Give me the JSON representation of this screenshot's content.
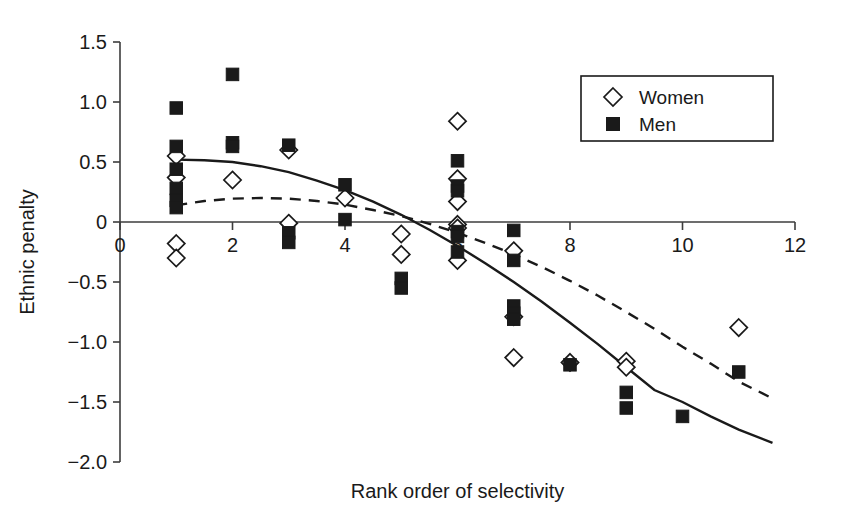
{
  "chart_data": {
    "type": "scatter",
    "title": "",
    "xlabel": "Rank order of selectivity",
    "ylabel": "Ethnic penalty",
    "xlim": [
      0,
      12
    ],
    "ylim": [
      -2.0,
      1.5
    ],
    "xticks": [
      0,
      2,
      4,
      6,
      8,
      10,
      12
    ],
    "xtick_labels": [
      "0",
      "2",
      "4",
      "6",
      "8",
      "10",
      "12"
    ],
    "yticks": [
      1.5,
      1.0,
      0.5,
      0,
      -0.5,
      -1.0,
      -1.5,
      -2.0
    ],
    "ytick_labels": [
      "1.5",
      "1.0",
      "0.5",
      "0",
      "−0.5",
      "−1.0",
      "−1.5",
      "−2.0"
    ],
    "grid": false,
    "zero_line": true,
    "legend_position": "top-right",
    "legend": [
      {
        "name": "Women",
        "marker": "open-diamond"
      },
      {
        "name": "Men",
        "marker": "filled-square"
      }
    ],
    "series": [
      {
        "name": "Women",
        "marker": "open-diamond",
        "points": [
          [
            1,
            0.55
          ],
          [
            1,
            0.37
          ],
          [
            1,
            -0.18
          ],
          [
            1,
            -0.3
          ],
          [
            2,
            0.35
          ],
          [
            3,
            0.6
          ],
          [
            3,
            -0.01
          ],
          [
            4,
            0.2
          ],
          [
            5,
            -0.1
          ],
          [
            5,
            -0.27
          ],
          [
            6,
            0.84
          ],
          [
            6,
            0.36
          ],
          [
            6,
            0.17
          ],
          [
            6,
            -0.02
          ],
          [
            6,
            -0.05
          ],
          [
            6,
            -0.32
          ],
          [
            7,
            -0.24
          ],
          [
            7,
            -0.79
          ],
          [
            7,
            -1.13
          ],
          [
            8,
            -1.17
          ],
          [
            9,
            -1.16
          ],
          [
            9,
            -1.21
          ],
          [
            11,
            -0.88
          ]
        ]
      },
      {
        "name": "Men",
        "marker": "filled-square",
        "points": [
          [
            1,
            0.95
          ],
          [
            1,
            0.63
          ],
          [
            1,
            0.44
          ],
          [
            1,
            0.28
          ],
          [
            1,
            0.18
          ],
          [
            1,
            0.12
          ],
          [
            2,
            1.23
          ],
          [
            2,
            0.66
          ],
          [
            2,
            0.63
          ],
          [
            3,
            0.64
          ],
          [
            3,
            -0.09
          ],
          [
            3,
            -0.17
          ],
          [
            4,
            0.31
          ],
          [
            4,
            0.02
          ],
          [
            5,
            -0.47
          ],
          [
            5,
            -0.55
          ],
          [
            6,
            0.51
          ],
          [
            6,
            0.3
          ],
          [
            6,
            0.26
          ],
          [
            6,
            -0.08
          ],
          [
            6,
            -0.12
          ],
          [
            6,
            -0.25
          ],
          [
            7,
            -0.07
          ],
          [
            7,
            -0.32
          ],
          [
            7,
            -0.7
          ],
          [
            7,
            -0.76
          ],
          [
            7,
            -0.81
          ],
          [
            8,
            -1.19
          ],
          [
            9,
            -1.42
          ],
          [
            9,
            -1.55
          ],
          [
            10,
            -1.62
          ],
          [
            11,
            -1.25
          ]
        ]
      }
    ],
    "fit_lines": [
      {
        "name": "Men fit",
        "style": "solid",
        "description": "Quadratic fit for Men, starts ~0.52 at x=1, crosses zero near x=4.9, ends ~-1.83 at x=11.6",
        "points": [
          [
            1.0,
            0.52
          ],
          [
            1.5,
            0.515
          ],
          [
            2.0,
            0.5
          ],
          [
            2.5,
            0.465
          ],
          [
            3.0,
            0.415
          ],
          [
            3.5,
            0.345
          ],
          [
            4.0,
            0.265
          ],
          [
            4.5,
            0.17
          ],
          [
            5.0,
            0.06
          ],
          [
            5.5,
            -0.065
          ],
          [
            6.0,
            -0.2
          ],
          [
            6.5,
            -0.345
          ],
          [
            7.0,
            -0.5
          ],
          [
            7.5,
            -0.665
          ],
          [
            8.0,
            -0.84
          ],
          [
            8.5,
            -1.02
          ],
          [
            9.0,
            -1.21
          ],
          [
            9.5,
            -1.4
          ],
          [
            10.0,
            -1.5
          ],
          [
            10.5,
            -1.62
          ],
          [
            11.0,
            -1.73
          ],
          [
            11.6,
            -1.84
          ]
        ]
      },
      {
        "name": "Women fit",
        "style": "dashed",
        "description": "Quadratic fit for Women, peaks ~0.20 near x=2.5, crosses zero near x=5.6, ends ~-1.47 at x=11.6",
        "points": [
          [
            1.0,
            0.14
          ],
          [
            1.5,
            0.175
          ],
          [
            2.0,
            0.195
          ],
          [
            2.5,
            0.2
          ],
          [
            3.0,
            0.195
          ],
          [
            3.5,
            0.175
          ],
          [
            4.0,
            0.145
          ],
          [
            4.5,
            0.1
          ],
          [
            5.0,
            0.05
          ],
          [
            5.5,
            -0.015
          ],
          [
            6.0,
            -0.09
          ],
          [
            6.5,
            -0.175
          ],
          [
            7.0,
            -0.27
          ],
          [
            7.5,
            -0.375
          ],
          [
            8.0,
            -0.49
          ],
          [
            8.5,
            -0.615
          ],
          [
            9.0,
            -0.75
          ],
          [
            9.5,
            -0.89
          ],
          [
            10.0,
            -1.04
          ],
          [
            10.5,
            -1.18
          ],
          [
            11.0,
            -1.33
          ],
          [
            11.6,
            -1.47
          ]
        ]
      }
    ]
  }
}
